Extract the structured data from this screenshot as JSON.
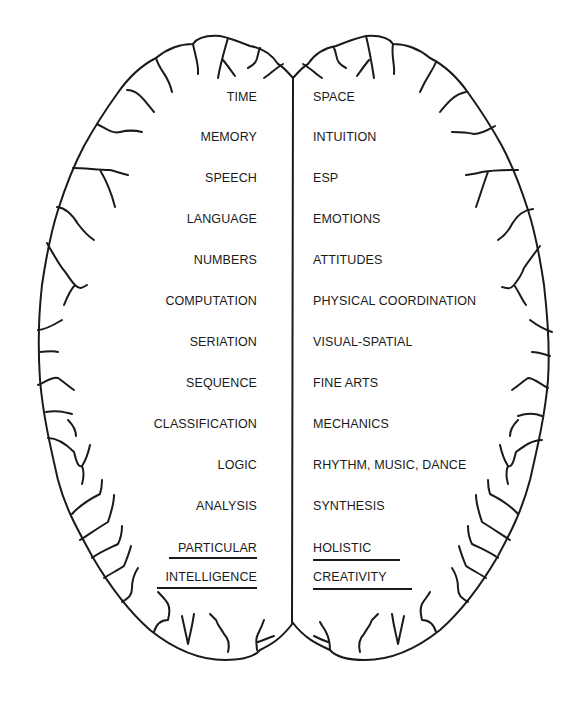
{
  "diagram": {
    "type": "brain-hemispheres",
    "left_hemisphere": {
      "labels": [
        "TIME",
        "MEMORY",
        "SPEECH",
        "LANGUAGE",
        "NUMBERS",
        "COMPUTATION",
        "SERIATION",
        "SEQUENCE",
        "CLASSIFICATION",
        "LOGIC",
        "ANALYSIS",
        "PARTICULAR",
        "INTELLIGENCE"
      ],
      "underlined": [
        "PARTICULAR",
        "INTELLIGENCE"
      ]
    },
    "right_hemisphere": {
      "labels": [
        "SPACE",
        "INTUITION",
        "ESP",
        "EMOTIONS",
        "ATTITUDES",
        "PHYSICAL COORDINATION",
        "VISUAL-SPATIAL",
        "FINE ARTS",
        "MECHANICS",
        "RHYTHM, MUSIC, DANCE",
        "SYNTHESIS",
        "HOLISTIC",
        "CREATIVITY"
      ],
      "underlined": [
        "HOLISTIC",
        "CREATIVITY"
      ]
    },
    "colors": {
      "ink": "#1a1a1a",
      "background": "#ffffff"
    }
  }
}
